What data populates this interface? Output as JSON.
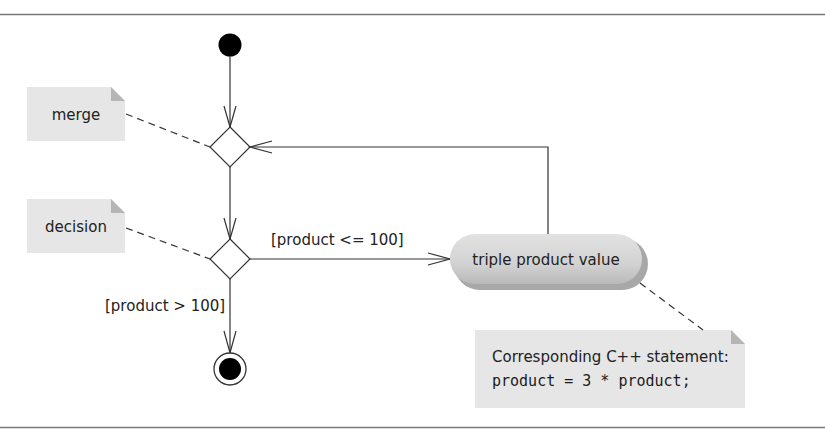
{
  "diagram": {
    "type": "UML activity diagram",
    "nodes": {
      "initial": {
        "kind": "initial-node"
      },
      "merge": {
        "kind": "merge-node"
      },
      "decision": {
        "kind": "decision-node"
      },
      "action": {
        "kind": "action-state",
        "label": "triple product value"
      },
      "final": {
        "kind": "final-node"
      }
    },
    "notes": {
      "merge": {
        "text": "merge"
      },
      "decision": {
        "text": "decision"
      },
      "statement": {
        "line1": "Corresponding C++ statement:",
        "line2": "product = 3 * product;"
      }
    },
    "guards": {
      "true_branch": "[product <= 100]",
      "false_branch": "[product > 100]"
    },
    "colors": {
      "line": "#333333",
      "note_fill": "#e6e6e6",
      "note_fold": "#b5b5b5",
      "action_fill": "#d4d4d4",
      "action_shadow": "#a8a8a8",
      "rule": "#7a7a7a"
    }
  }
}
